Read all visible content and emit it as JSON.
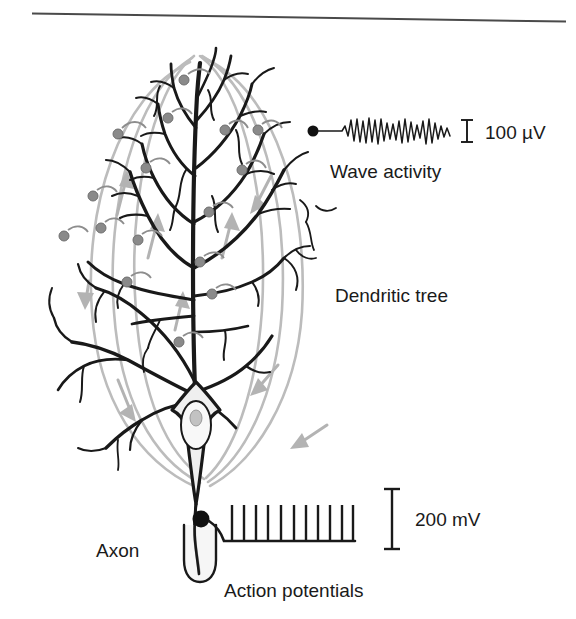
{
  "figure": {
    "title_rule": "horizontal-rule",
    "labels": {
      "wave_activity": "Wave activity",
      "dendritic_tree": "Dendritic tree",
      "axon": "Axon",
      "action_potentials": "Action potentials"
    },
    "scale_bars": [
      {
        "name": "eeg-scale",
        "value": "100 µV",
        "height_px": 22
      },
      {
        "name": "spike-scale",
        "value": "200 mV",
        "height_px": 60
      }
    ],
    "traces": {
      "eeg": {
        "name": "wave-activity-trace",
        "description": "irregular oscillating EEG waveform",
        "flat_lead_in": true,
        "electrode_dot": true
      },
      "spikes": {
        "name": "action-potential-trace",
        "description": "train of vertical spikes on a baseline",
        "spike_count": 11,
        "electrode_dot": true
      }
    },
    "neuron": {
      "soma": "pyramidal cell body with nucleus and nucleolus",
      "apical_dendrite": "vertical trunk with branching tree",
      "basal_dendrites": "lateral branches near soma",
      "axon": "descends from soma through myelin sheath",
      "synaptic_boutons": 16,
      "field_lines": 6,
      "current_arrows": 8
    },
    "colors": {
      "ink": "#1a1a1a",
      "field_line": "#b9b9b9",
      "arrow": "#b0b0b0",
      "bouton_fill": "#8a8a8a",
      "bouton_stroke": "#6f6f6f",
      "soma_fill": "#efefef",
      "nucleus_fill": "#f7f7f7",
      "nucleolus_fill": "#c2c2c2",
      "background": "#ffffff"
    }
  }
}
